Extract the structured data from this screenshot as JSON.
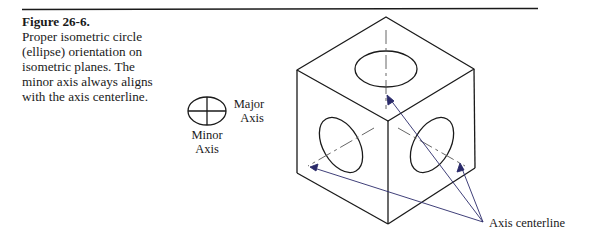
{
  "figure": {
    "number": "Figure 26-6.",
    "caption": "Proper isometric circle (ellipse) orientation on isometric planes. The minor axis always aligns with the axis centerline."
  },
  "legend_ellipse": {
    "major_label_line1": "Major",
    "major_label_line2": "Axis",
    "minor_label_line1": "Minor",
    "minor_label_line2": "Axis"
  },
  "cube": {
    "callout_label": "Axis centerline"
  },
  "colors": {
    "line": "#1a1a1a",
    "leader": "#2a2a6a"
  }
}
